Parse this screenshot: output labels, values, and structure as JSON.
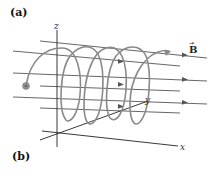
{
  "figure": {
    "panel_labels": {
      "a": "(a)",
      "b": "(b)"
    },
    "axes": {
      "x": "x",
      "y": "y",
      "z": "z"
    },
    "field_label": "B",
    "field_vector_arrow": "→",
    "colors": {
      "field_lines": "#555555",
      "helix": "#8a8a8a",
      "axes": "#222222",
      "particle": "#777777"
    }
  }
}
